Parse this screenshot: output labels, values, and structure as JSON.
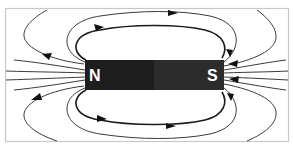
{
  "diagram": {
    "magnet": {
      "north_label": "N",
      "south_label": "S",
      "north_color": "#1e1e1e",
      "south_color": "#2c2c2c"
    },
    "colors": {
      "frame_border": "#c8c8c8",
      "field_line": "#3a3a3a",
      "arrow": "#111111",
      "label": "#ffffff"
    },
    "field_line_direction": "N to S (outside magnet)"
  }
}
